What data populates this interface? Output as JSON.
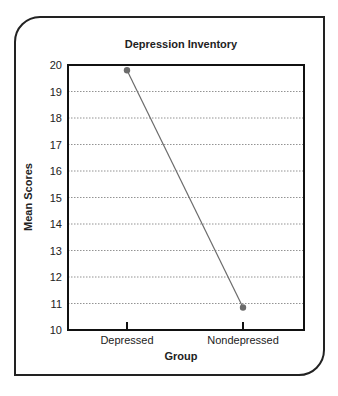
{
  "chart_data": {
    "type": "line",
    "title": "Depression Inventory",
    "xlabel": "Group",
    "ylabel": "Mean Scores",
    "categories": [
      "Depressed",
      "Nondepressed"
    ],
    "series": [
      {
        "name": "Mean Scores",
        "values": [
          19.8,
          10.85
        ],
        "color": "#6b6b6b"
      }
    ],
    "ylim": [
      10,
      20
    ],
    "yticks": [
      "10",
      "11",
      "12",
      "13",
      "14",
      "15",
      "16",
      "17",
      "18",
      "19",
      "20"
    ],
    "grid": "horizontal dotted",
    "legend": "none"
  }
}
